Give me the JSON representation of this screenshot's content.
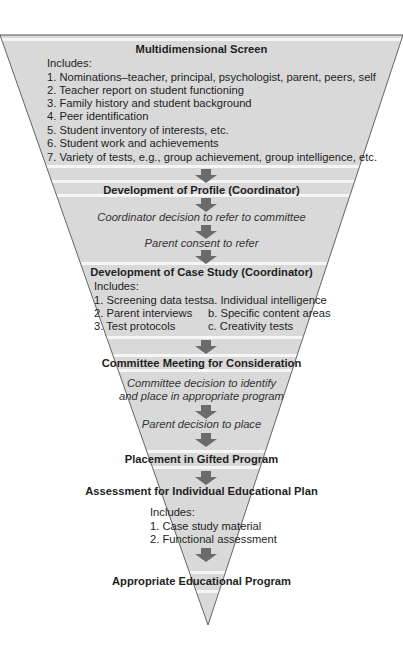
{
  "diagram": {
    "type": "inverted-funnel-flowchart",
    "colors": {
      "funnel_fill": "#d9d9d9",
      "funnel_edge": "#555555",
      "band": "#f4f4f4",
      "arrow": "#6b6b6b",
      "text": "#1e1e1e"
    },
    "stages": [
      {
        "title": "Multidimensional Screen",
        "includes_label": "Includes:",
        "items": [
          "1. Nominations–teacher, principal, psychologist, parent, peers, self",
          "2. Teacher report  on student functioning",
          "3. Family history and student background",
          "4. Peer identification",
          "5. Student inventory of interests, etc.",
          "6. Student work and  achievements",
          "7. Variety of tests, e.g., group achievement, group intelligence, etc."
        ]
      },
      {
        "title": "Development of Profile (Coordinator)",
        "steps": [
          "Coordinator decision to refer to committee",
          "Parent consent to refer"
        ]
      },
      {
        "title": "Development of Case Study (Coordinator)",
        "includes_label": "Includes:",
        "left_items": [
          "1. Screening data tests",
          "2. Parent interviews",
          "3. Test protocols"
        ],
        "right_items": [
          "a. Individual intelligence",
          "b. Specific content areas",
          "c. Creativity tests"
        ]
      },
      {
        "title": "Committee Meeting for Consideration",
        "steps": [
          "Committee decision to identify",
          "and place in appropriate program",
          "Parent decision to place"
        ]
      },
      {
        "title": "Placement in Gifted Program"
      },
      {
        "title": "Assessment for Individual Educational Plan",
        "includes_label": "Includes:",
        "items": [
          "1.  Case study material",
          "2. Functional assessment"
        ]
      },
      {
        "title": "Appropriate Educational Program"
      }
    ]
  }
}
